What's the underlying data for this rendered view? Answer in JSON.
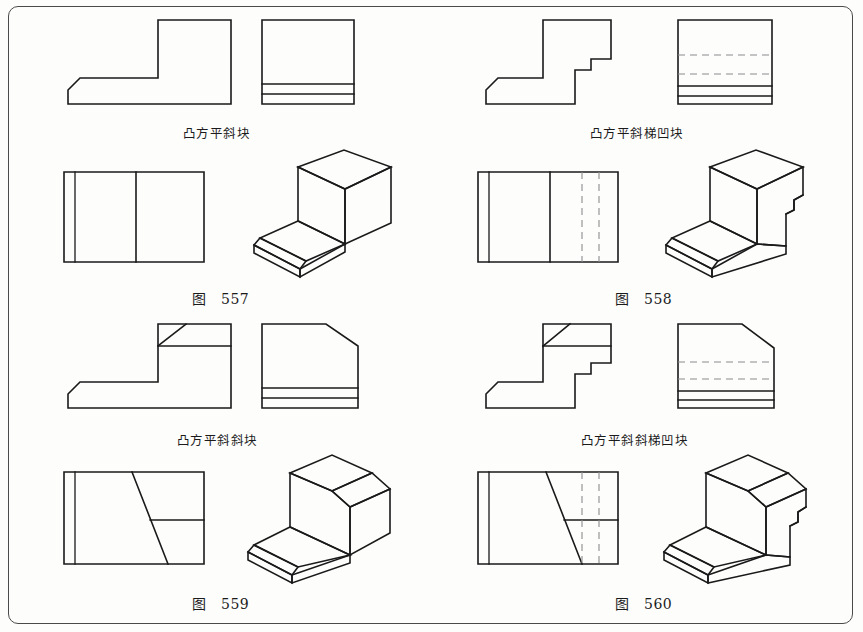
{
  "page": {
    "background_color": "#fdfdfc",
    "line_color": "#1a1a1a",
    "hidden_line_color": "#8c8c8c",
    "border": true
  },
  "figures": [
    {
      "id": "fig-557",
      "number_prefix": "图",
      "number": "557",
      "name": "凸方平斜块",
      "views": [
        "front-view",
        "side-view",
        "top-view",
        "isometric-view"
      ],
      "has_hidden_lines": false,
      "features": [
        "L-shaped block",
        "chamfered front lower edge",
        "flat top"
      ]
    },
    {
      "id": "fig-558",
      "number_prefix": "图",
      "number": "558",
      "name": "凸方平斜梯凹块",
      "views": [
        "front-view",
        "side-view",
        "top-view",
        "isometric-view"
      ],
      "has_hidden_lines": true,
      "features": [
        "L-shaped block",
        "chamfered front lower edge",
        "stepped notch at right",
        "flat top"
      ]
    },
    {
      "id": "fig-559",
      "number_prefix": "图",
      "number": "559",
      "name": "凸方平斜斜块",
      "views": [
        "front-view",
        "side-view",
        "top-view",
        "isometric-view"
      ],
      "has_hidden_lines": false,
      "features": [
        "L-shaped block",
        "chamfered front lower edge",
        "inclined top surface",
        "oblique cut"
      ]
    },
    {
      "id": "fig-560",
      "number_prefix": "图",
      "number": "560",
      "name": "凸方平斜斜梯凹块",
      "views": [
        "front-view",
        "side-view",
        "top-view",
        "isometric-view"
      ],
      "has_hidden_lines": true,
      "features": [
        "L-shaped block",
        "chamfered front lower edge",
        "inclined top surface",
        "stepped notch at right"
      ]
    }
  ]
}
